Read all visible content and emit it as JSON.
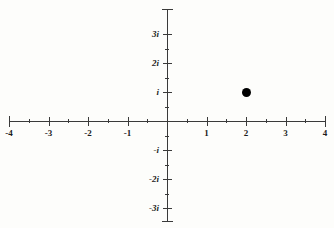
{
  "figure": {
    "kind": "complex-plane",
    "background_color": "#fdfdfb",
    "axis_color": "#3a3a3a",
    "label_color": "#1c1c1c",
    "point_color": "#000000"
  },
  "chart_data": {
    "type": "scatter",
    "title": "",
    "subtitle": "",
    "xlabel": "",
    "ylabel": "",
    "xlim": [
      -4,
      4
    ],
    "ylim": [
      -3.5,
      3.5
    ],
    "grid": false,
    "legend": null,
    "plane": "complex",
    "x_axis": {
      "name": "real-axis",
      "major_ticks": [
        -4,
        -3,
        -2,
        -1,
        0,
        1,
        2,
        3,
        4
      ],
      "minor_ticks": [
        -3.5,
        -2.5,
        -1.5,
        -0.5,
        0.5,
        1.5,
        2.5,
        3.5
      ],
      "tick_labels": [
        {
          "value": -4,
          "text": "-4"
        },
        {
          "value": -3,
          "text": "-3"
        },
        {
          "value": -2,
          "text": "-2"
        },
        {
          "value": -1,
          "text": "-1"
        },
        {
          "value": 1,
          "text": "1"
        },
        {
          "value": 2,
          "text": "2"
        },
        {
          "value": 3,
          "text": "3"
        },
        {
          "value": 4,
          "text": "4"
        }
      ]
    },
    "y_axis": {
      "name": "imaginary-axis",
      "major_ticks": [
        -3,
        -2,
        -1,
        0,
        1,
        2,
        3
      ],
      "minor_ticks": [
        -2.5,
        -1.5,
        -0.5,
        0.5,
        1.5,
        2.5
      ],
      "tick_labels": [
        {
          "value": 3,
          "text": "3i"
        },
        {
          "value": 2,
          "text": "2i"
        },
        {
          "value": 1,
          "text": "i"
        },
        {
          "value": -1,
          "text": "-i"
        },
        {
          "value": -2,
          "text": "-2i"
        },
        {
          "value": -3,
          "text": "-3i"
        }
      ]
    },
    "points": [
      {
        "label": "2 + i",
        "real": 2,
        "imaginary": 1,
        "marker": "filled-circle"
      }
    ]
  }
}
